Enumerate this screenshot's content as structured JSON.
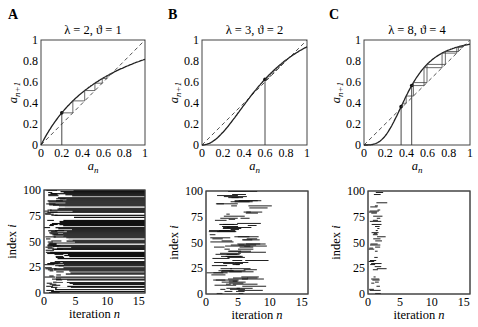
{
  "chart_data": [
    {
      "panel": "A",
      "type": "line",
      "title": "λ = 2, ϑ = 1",
      "xlabel": "a_n",
      "ylabel": "a_{n+1}",
      "xlim": [
        0,
        1
      ],
      "ylim": [
        0,
        1
      ],
      "xticks": [
        "0",
        "0.2",
        "0.4",
        "0.6",
        "0.8",
        "1"
      ],
      "yticks": [
        "0",
        "0.2",
        "0.4",
        "0.6",
        "0.8",
        "1"
      ],
      "lambda": 2,
      "theta": 1,
      "series": [
        {
          "name": "map",
          "style": "solid"
        },
        {
          "name": "identity",
          "style": "dashed"
        },
        {
          "name": "cobweb",
          "start": 0.2
        }
      ],
      "start_points": [
        0.2
      ]
    },
    {
      "panel": "B",
      "type": "line",
      "title": "λ = 3, ϑ = 2",
      "xlabel": "a_n",
      "ylabel": "a_{n+1}",
      "xlim": [
        0,
        1
      ],
      "ylim": [
        0,
        1
      ],
      "xticks": [
        "0",
        "0.2",
        "0.4",
        "0.6",
        "0.8",
        "1"
      ],
      "yticks": [
        "0",
        "0.2",
        "0.4",
        "0.6",
        "0.8",
        "1"
      ],
      "lambda": 3,
      "theta": 2,
      "series": [
        {
          "name": "map",
          "style": "solid"
        },
        {
          "name": "identity",
          "style": "dashed"
        },
        {
          "name": "cobweb",
          "start": 0.6
        }
      ],
      "start_points": [
        0.6
      ]
    },
    {
      "panel": "C",
      "type": "line",
      "title": "λ = 8, ϑ = 4",
      "xlabel": "a_n",
      "ylabel": "a_{n+1}",
      "xlim": [
        0,
        1
      ],
      "ylim": [
        0,
        1
      ],
      "xticks": [
        "0",
        "0.2",
        "0.4",
        "0.6",
        "0.8",
        "1"
      ],
      "yticks": [
        "0",
        "0.2",
        "0.4",
        "0.6",
        "0.8",
        "1"
      ],
      "lambda": 8,
      "theta": 4,
      "series": [
        {
          "name": "map",
          "style": "solid"
        },
        {
          "name": "identity",
          "style": "dashed"
        },
        {
          "name": "cobweb",
          "starts": [
            0.35,
            0.45
          ]
        }
      ],
      "start_points": [
        0.35,
        0.45
      ]
    },
    {
      "panel": "A-bottom",
      "type": "heatmap",
      "xlabel": "iteration n",
      "ylabel": "index i",
      "xlim": [
        0,
        16
      ],
      "ylim": [
        0,
        100
      ],
      "xticks": [
        "0",
        "5",
        "10",
        "15"
      ],
      "yticks": [
        "0",
        "25",
        "50",
        "75",
        "100"
      ],
      "description": "raster: most rows become active after n≈2-5 and stay active to n=16",
      "density": "high"
    },
    {
      "panel": "B-bottom",
      "type": "heatmap",
      "xlabel": "iteration n",
      "ylabel": "index i",
      "xlim": [
        0,
        16
      ],
      "ylim": [
        0,
        100
      ],
      "xticks": [
        "0",
        "5",
        "10",
        "15"
      ],
      "yticks": [
        "0",
        "25",
        "50",
        "75",
        "100"
      ],
      "description": "raster: scattered activity bursts, dying out by n≈11",
      "density": "medium"
    },
    {
      "panel": "C-bottom",
      "type": "heatmap",
      "xlabel": "iteration n",
      "ylabel": "index i",
      "xlim": [
        0,
        16
      ],
      "ylim": [
        0,
        100
      ],
      "xticks": [
        "0",
        "5",
        "10",
        "15"
      ],
      "yticks": [
        "0",
        "25",
        "50",
        "75",
        "100"
      ],
      "description": "raster: sparse activity, dies out by n≈4",
      "density": "low"
    }
  ],
  "labels": {
    "panels": [
      "A",
      "B",
      "C"
    ],
    "titles": [
      "λ = 2, ϑ = 1",
      "λ = 3, ϑ = 2",
      "λ = 8, ϑ = 4"
    ],
    "top_xlabel": "a",
    "top_xlabel_sub": "n",
    "top_ylabel": "a",
    "top_ylabel_sub": "n+1",
    "bottom_xlabel": "iteration ",
    "bottom_xlabel_var": "n",
    "bottom_ylabel": "index ",
    "bottom_ylabel_var": "i"
  }
}
